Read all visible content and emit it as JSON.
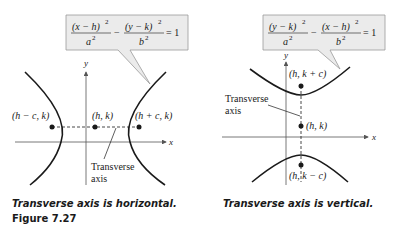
{
  "left_figure": {
    "equation": {
      "term1_num": "(x − h)",
      "term1_den": "a",
      "minus": "−",
      "term2_num": "(y − k)",
      "term2_den": "b",
      "exp": "2",
      "rhs": "= 1"
    },
    "axis_labels": {
      "x": "x",
      "y": "y"
    },
    "points": {
      "left_focus": "(h − c, k)",
      "center": "(h, k)",
      "right_focus": "(h + c, k)"
    },
    "transverse_label_line1": "Transverse",
    "transverse_label_line2": "axis",
    "caption": "Transverse axis is horizontal.",
    "figure_number": "Figure 7.27"
  },
  "right_figure": {
    "equation": {
      "term1_num": "(y − k)",
      "term1_den": "a",
      "minus": "−",
      "term2_num": "(x − h)",
      "term2_den": "b",
      "exp": "2",
      "rhs": "= 1"
    },
    "axis_labels": {
      "x": "x",
      "y": "y"
    },
    "points": {
      "upper_focus": "(h, k + c)",
      "center": "(h, k)",
      "lower_focus": "(h, k − c)"
    },
    "transverse_label_line1": "Transverse",
    "transverse_label_line2": "axis",
    "caption": "Transverse axis is vertical."
  },
  "colors": {
    "callout_fill": "#ebebeb",
    "callout_border": "#999999",
    "curve": "#1a1a1a",
    "axis": "#555555"
  }
}
